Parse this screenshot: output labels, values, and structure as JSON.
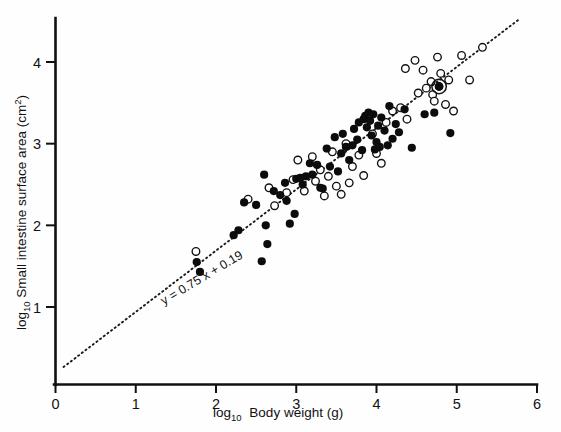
{
  "chart_data": {
    "type": "scatter",
    "title": "",
    "xlabel": "log10 Body weight (g)",
    "ylabel": "log10 Small intestine surface area (cm2)",
    "xlabel_base": "log",
    "xlabel_sub": "10",
    "xlabel_rest": "Body weight (g)",
    "ylabel_base": "log",
    "ylabel_sub": "10",
    "ylabel_rest": "Small intestine surface area (cm",
    "ylabel_sup": "2",
    "ylabel_close": ")",
    "xlim": [
      0,
      6
    ],
    "ylim": [
      0.29,
      4.45
    ],
    "xticks": [
      0,
      1,
      2,
      3,
      4,
      5,
      6
    ],
    "xtick_labels": [
      "0",
      "1",
      "2",
      "3",
      "4",
      "5",
      "6"
    ],
    "yticks": [
      1,
      2,
      3,
      4
    ],
    "ytick_labels": [
      "1",
      "2",
      "3",
      "4"
    ],
    "grid": false,
    "legend": "none",
    "annotations": [
      {
        "name": "regression-equation",
        "text": "y = 0.75 x + 0.19",
        "x": 1.35,
        "y": 1.02,
        "rotation": -31
      }
    ],
    "fit_line": {
      "name": "regression-line",
      "equation": "y = 0.75 x + 0.19",
      "slope": 0.75,
      "intercept": 0.19,
      "style": "dotted",
      "x_start": 0.1,
      "x_end": 5.78
    },
    "series": [
      {
        "name": "filled-circles",
        "marker": "filled-circle",
        "color": "#0c0c0c",
        "points": [
          [
            1.76,
            1.55
          ],
          [
            1.8,
            1.43
          ],
          [
            2.22,
            1.88
          ],
          [
            2.28,
            1.94
          ],
          [
            2.35,
            2.28
          ],
          [
            2.5,
            2.25
          ],
          [
            2.57,
            1.56
          ],
          [
            2.62,
            2.0
          ],
          [
            2.64,
            1.77
          ],
          [
            2.72,
            2.42
          ],
          [
            2.8,
            2.37
          ],
          [
            2.86,
            2.52
          ],
          [
            2.88,
            2.3
          ],
          [
            2.92,
            2.02
          ],
          [
            3.0,
            2.57
          ],
          [
            3.05,
            2.58
          ],
          [
            3.08,
            2.5
          ],
          [
            3.12,
            2.6
          ],
          [
            3.17,
            2.76
          ],
          [
            3.2,
            2.62
          ],
          [
            3.26,
            2.74
          ],
          [
            3.3,
            2.46
          ],
          [
            3.33,
            2.45
          ],
          [
            3.38,
            2.94
          ],
          [
            3.42,
            2.72
          ],
          [
            3.48,
            3.08
          ],
          [
            3.52,
            2.66
          ],
          [
            3.56,
            2.88
          ],
          [
            3.58,
            3.12
          ],
          [
            3.62,
            2.96
          ],
          [
            3.66,
            2.8
          ],
          [
            3.7,
            2.98
          ],
          [
            3.72,
            3.18
          ],
          [
            3.76,
            3.05
          ],
          [
            3.78,
            3.26
          ],
          [
            3.82,
            2.92
          ],
          [
            3.84,
            3.3
          ],
          [
            3.86,
            3.34
          ],
          [
            3.88,
            3.2
          ],
          [
            3.9,
            3.38
          ],
          [
            3.92,
            3.28
          ],
          [
            3.94,
            3.1
          ],
          [
            3.96,
            3.36
          ],
          [
            3.98,
            2.93
          ],
          [
            4.0,
            3.02
          ],
          [
            4.02,
            3.22
          ],
          [
            4.04,
            2.96
          ],
          [
            4.06,
            3.32
          ],
          [
            4.1,
            3.16
          ],
          [
            4.14,
            2.98
          ],
          [
            4.16,
            3.46
          ],
          [
            4.2,
            3.06
          ],
          [
            4.24,
            3.24
          ],
          [
            4.28,
            3.14
          ],
          [
            4.35,
            3.42
          ],
          [
            4.44,
            2.95
          ],
          [
            4.6,
            3.36
          ],
          [
            4.72,
            3.38
          ],
          [
            4.78,
            3.7
          ],
          [
            4.92,
            3.13
          ],
          [
            2.98,
            2.14
          ],
          [
            2.6,
            2.62
          ]
        ]
      },
      {
        "name": "open-circles",
        "marker": "open-circle",
        "color": "#ffffff",
        "points": [
          [
            1.75,
            1.68
          ],
          [
            2.4,
            2.32
          ],
          [
            2.66,
            2.46
          ],
          [
            2.73,
            2.24
          ],
          [
            2.88,
            2.4
          ],
          [
            2.96,
            2.56
          ],
          [
            3.02,
            2.8
          ],
          [
            3.1,
            2.42
          ],
          [
            3.2,
            2.84
          ],
          [
            3.24,
            2.54
          ],
          [
            3.3,
            2.68
          ],
          [
            3.35,
            2.36
          ],
          [
            3.4,
            2.6
          ],
          [
            3.45,
            2.9
          ],
          [
            3.5,
            2.48
          ],
          [
            3.56,
            2.38
          ],
          [
            3.62,
            3.0
          ],
          [
            3.7,
            2.72
          ],
          [
            3.78,
            2.86
          ],
          [
            3.84,
            2.61
          ],
          [
            3.95,
            3.12
          ],
          [
            4.0,
            2.88
          ],
          [
            4.06,
            2.76
          ],
          [
            4.12,
            3.26
          ],
          [
            4.2,
            3.4
          ],
          [
            4.3,
            3.44
          ],
          [
            4.38,
            3.3
          ],
          [
            4.52,
            3.62
          ],
          [
            4.58,
            3.9
          ],
          [
            4.62,
            3.68
          ],
          [
            4.68,
            3.76
          ],
          [
            4.7,
            3.6
          ],
          [
            4.72,
            3.52
          ],
          [
            4.76,
            4.06
          ],
          [
            4.8,
            3.86
          ],
          [
            4.86,
            3.48
          ],
          [
            4.9,
            3.78
          ],
          [
            4.96,
            3.4
          ],
          [
            5.06,
            4.08
          ],
          [
            5.16,
            3.78
          ],
          [
            5.32,
            4.18
          ],
          [
            4.48,
            4.02
          ],
          [
            4.36,
            3.92
          ],
          [
            3.66,
            2.52
          ]
        ]
      },
      {
        "name": "highlighted-point",
        "marker": "filled-circle-with-ring",
        "color": "#0c0c0c",
        "points": [
          [
            4.78,
            3.7
          ]
        ]
      }
    ]
  },
  "axes": {
    "x_axis_name": "x-axis",
    "y_axis_name": "y-axis"
  }
}
